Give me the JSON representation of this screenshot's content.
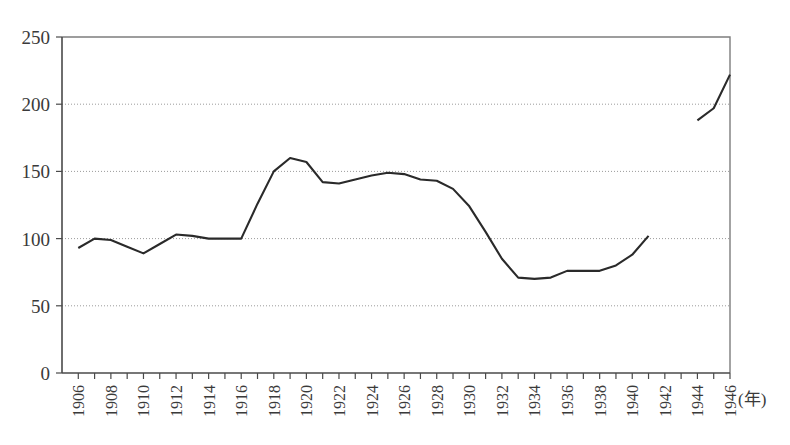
{
  "chart_data": {
    "type": "line",
    "title": "",
    "subtitle": "",
    "xlabel": "(年)",
    "ylabel": "",
    "xlim": [
      1905,
      1946
    ],
    "ylim": [
      0,
      250
    ],
    "grid": true,
    "legend": false,
    "legend_position": "none",
    "y_ticks": [
      0,
      50,
      100,
      150,
      200,
      250
    ],
    "y_tick_labels": [
      "0",
      "50",
      "100",
      "150",
      "200",
      "250"
    ],
    "x_ticks": [
      1906,
      1907,
      1908,
      1909,
      1910,
      1911,
      1912,
      1913,
      1914,
      1915,
      1916,
      1917,
      1918,
      1919,
      1920,
      1921,
      1922,
      1923,
      1924,
      1925,
      1926,
      1927,
      1928,
      1929,
      1930,
      1931,
      1932,
      1933,
      1934,
      1935,
      1936,
      1937,
      1938,
      1939,
      1940,
      1941,
      1942,
      1943,
      1944,
      1945,
      1946
    ],
    "x_tick_labels": [
      "1906",
      "1908",
      "1910",
      "1912",
      "1914",
      "1916",
      "1918",
      "1920",
      "1922",
      "1924",
      "1926",
      "1928",
      "1930",
      "1932",
      "1934",
      "1936",
      "1938",
      "1940",
      "1942",
      "1944",
      "1946"
    ],
    "x_tick_label_years": [
      1906,
      1908,
      1910,
      1912,
      1914,
      1916,
      1918,
      1920,
      1922,
      1924,
      1926,
      1928,
      1930,
      1932,
      1934,
      1936,
      1938,
      1940,
      1942,
      1944,
      1946
    ],
    "x_label_rotation": -90,
    "series": [
      {
        "name": "index",
        "color": "#2a2a2a",
        "x": [
          1906,
          1907,
          1908,
          1909,
          1910,
          1911,
          1912,
          1913,
          1914,
          1915,
          1916,
          1917,
          1918,
          1919,
          1920,
          1921,
          1922,
          1923,
          1924,
          1925,
          1926,
          1927,
          1928,
          1929,
          1930,
          1931,
          1932,
          1933,
          1934,
          1935,
          1936,
          1937,
          1938,
          1939,
          1940,
          1941
        ],
        "values": [
          93,
          100,
          99,
          94,
          89,
          96,
          103,
          102,
          100,
          100,
          100,
          126,
          150,
          160,
          157,
          142,
          141,
          144,
          147,
          149,
          148,
          144,
          143,
          137,
          124,
          105,
          85,
          71,
          70,
          71,
          76,
          76,
          76,
          80,
          88,
          102
        ]
      },
      {
        "name": "index-postwar",
        "color": "#2a2a2a",
        "x": [
          1944,
          1945,
          1946
        ],
        "values": [
          188,
          197,
          222
        ]
      }
    ],
    "gap_note": "data break between 1941 and 1944"
  }
}
